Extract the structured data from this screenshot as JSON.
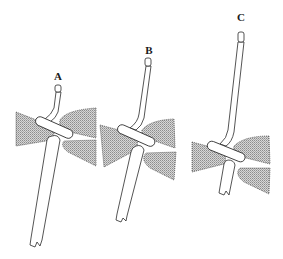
{
  "figure": {
    "panels": [
      {
        "id": "A",
        "label": "A"
      },
      {
        "id": "B",
        "label": "B"
      },
      {
        "id": "C",
        "label": "C"
      }
    ],
    "colors": {
      "background": "#ffffff",
      "outline": "#2a2a2a",
      "stipple": "#9a9a9a"
    }
  }
}
